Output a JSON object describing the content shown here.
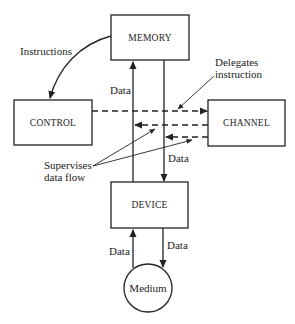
{
  "diagram": {
    "nodes": {
      "memory": {
        "label": "MEMORY"
      },
      "control": {
        "label": "CONTROL"
      },
      "channel": {
        "label": "CHANNEL"
      },
      "device": {
        "label": "DEVICE"
      },
      "medium": {
        "label": "Medium"
      }
    },
    "annotations": {
      "instructions": "Instructions",
      "delegates_line1": "Delegates",
      "delegates_line2": "instruction",
      "supervises_line1": "Supervises",
      "supervises_line2": "data flow",
      "data_memory_up": "Data",
      "data_memory_down": "Data",
      "data_device_up": "Data",
      "data_device_down": "Data"
    },
    "edges": [
      {
        "from": "MEMORY",
        "to": "CONTROL",
        "label": "Instructions",
        "style": "solid-curved"
      },
      {
        "from": "DEVICE",
        "to": "MEMORY",
        "label": "Data",
        "style": "solid"
      },
      {
        "from": "MEMORY",
        "to": "DEVICE",
        "label": "Data",
        "style": "solid"
      },
      {
        "from": "CONTROL",
        "to": "CHANNEL",
        "label": "Delegates instruction",
        "style": "dashed"
      },
      {
        "from": "CHANNEL",
        "to": "DEVICE->MEMORY path",
        "label": "Supervises data flow",
        "style": "dashed"
      },
      {
        "from": "CHANNEL",
        "to": "MEMORY->DEVICE path",
        "label": "Supervises data flow",
        "style": "dashed"
      },
      {
        "from": "Medium",
        "to": "DEVICE",
        "label": "Data",
        "style": "solid"
      },
      {
        "from": "DEVICE",
        "to": "Medium",
        "label": "Data",
        "style": "solid"
      }
    ]
  }
}
